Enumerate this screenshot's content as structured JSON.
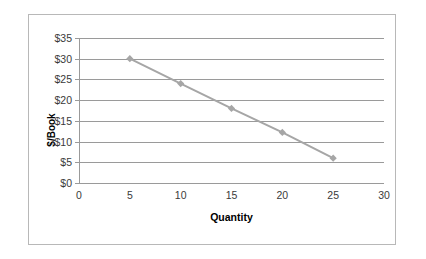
{
  "chart_data": {
    "type": "line",
    "title": "",
    "xlabel": "Quantity",
    "ylabel": "$/Book",
    "x": [
      5,
      10,
      15,
      20,
      25
    ],
    "values": [
      30,
      24,
      18,
      12.2,
      6
    ],
    "series": [
      {
        "name": "Demand",
        "x": [
          5,
          10,
          15,
          20,
          25
        ],
        "values": [
          30,
          24,
          18,
          12.2,
          6
        ]
      }
    ],
    "xlim": [
      0,
      30
    ],
    "ylim": [
      0,
      35
    ],
    "x_ticks": [
      0,
      5,
      10,
      15,
      20,
      25,
      30
    ],
    "x_tick_labels": [
      "0",
      "5",
      "10",
      "15",
      "20",
      "25",
      "30"
    ],
    "y_ticks": [
      0,
      5,
      10,
      15,
      20,
      25,
      30,
      35
    ],
    "y_tick_labels": [
      "$0",
      "$5",
      "$10",
      "$15",
      "$20",
      "$25",
      "$30",
      "$35"
    ],
    "grid": "horizontal",
    "legend": "none",
    "marker": "diamond",
    "series_color": "#a6a6a6",
    "grid_color": "#9a9a9a",
    "axis_text_color": "#3a3a3a",
    "title_color": "#000000",
    "frame_color": "#b8b8b8",
    "background_color": "#ffffff"
  }
}
